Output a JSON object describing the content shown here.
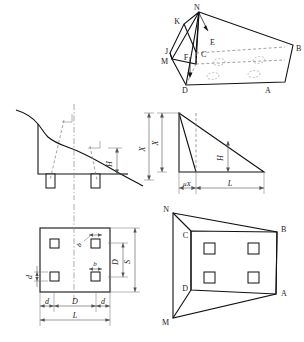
{
  "figure": {
    "panels": [
      {
        "id": "top-right-3d",
        "name": "isometric-wedge-view"
      },
      {
        "id": "mid-left-section",
        "name": "slope-terrain-section"
      },
      {
        "id": "mid-right-triangle",
        "name": "idealized-slope-triangle"
      },
      {
        "id": "bottom-left-plan",
        "name": "foundation-plan-view"
      },
      {
        "id": "bottom-right-perspective",
        "name": "foundation-perspective-view"
      }
    ]
  },
  "isometric": {
    "vertices": {
      "N": "N",
      "K": "K",
      "E": "E",
      "J": "J",
      "M": "M",
      "F": "F",
      "C": "C",
      "B": "B",
      "D": "D",
      "A": "A"
    }
  },
  "section": {
    "label_H": "H"
  },
  "triangle": {
    "label_X": "X",
    "label_muX": "μX",
    "label_L": "L",
    "label_H": "H"
  },
  "plan": {
    "label_d_left": "d",
    "label_D": "D",
    "label_d_right": "d",
    "label_L": "L",
    "label_d_vert": "d",
    "label_Q": "D",
    "label_S": "S",
    "label_b_upper": "b",
    "label_b_lower": "b"
  },
  "perspective": {
    "vertices": {
      "N": "N",
      "C": "C",
      "B": "B",
      "D": "D",
      "A": "A",
      "M": "M"
    }
  },
  "colors": {
    "line": "#111111",
    "dash": "#7a7a7a",
    "dim": "#555555",
    "background": "#ffffff"
  }
}
